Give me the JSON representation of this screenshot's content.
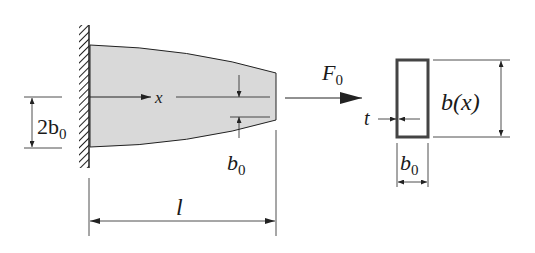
{
  "diagram": {
    "type": "cantilever-beam-variable-width",
    "colors": {
      "beam_fill": "#d9d9d9",
      "stroke": "#222222",
      "background": "#ffffff"
    },
    "labels": {
      "axis_x": "x",
      "force": "F",
      "force_sub": "0",
      "height_dim_coef": "2b",
      "height_dim_sub": "0",
      "end_gap": "b",
      "end_gap_sub": "0",
      "length": "l",
      "thickness": "t",
      "section_height": "b(x)",
      "section_width": "b",
      "section_width_sub": "0"
    }
  }
}
